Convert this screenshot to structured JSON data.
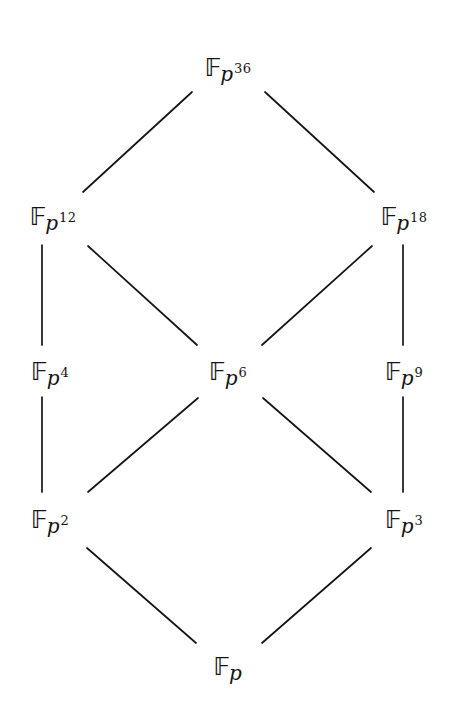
{
  "figure": {
    "name": "subfield-lattice-of-finite-field",
    "background_color": "#ffffff",
    "ink_color": "#141414",
    "width": 456,
    "height": 712
  },
  "nodes": [
    {
      "id": "p36",
      "base": "𝔽",
      "sub": "p",
      "exp": "36",
      "label": "F_p^36",
      "x": 228,
      "y": 66
    },
    {
      "id": "p12",
      "base": "𝔽",
      "sub": "p",
      "exp": "12",
      "label": "F_p^12",
      "x": 53,
      "y": 215
    },
    {
      "id": "p18",
      "base": "𝔽",
      "sub": "p",
      "exp": "18",
      "label": "F_p^18",
      "x": 404,
      "y": 215
    },
    {
      "id": "p4",
      "base": "𝔽",
      "sub": "p",
      "exp": "4",
      "label": "F_p^4",
      "x": 50,
      "y": 370
    },
    {
      "id": "p6",
      "base": "𝔽",
      "sub": "p",
      "exp": "6",
      "label": "F_p^6",
      "x": 228,
      "y": 370
    },
    {
      "id": "p9",
      "base": "𝔽",
      "sub": "p",
      "exp": "9",
      "label": "F_p^9",
      "x": 404,
      "y": 370
    },
    {
      "id": "p2",
      "base": "𝔽",
      "sub": "p",
      "exp": "2",
      "label": "F_p^2",
      "x": 50,
      "y": 518
    },
    {
      "id": "p3",
      "base": "𝔽",
      "sub": "p",
      "exp": "3",
      "label": "F_p^3",
      "x": 404,
      "y": 518
    },
    {
      "id": "p",
      "base": "𝔽",
      "sub": "p",
      "exp": "",
      "label": "F_p",
      "x": 228,
      "y": 665
    }
  ],
  "edges": [
    {
      "id": "e-p36-p12",
      "from": "p36",
      "to": "p12",
      "x1": 192,
      "y1": 92,
      "x2": 83,
      "y2": 192
    },
    {
      "id": "e-p36-p18",
      "from": "p36",
      "to": "p18",
      "x1": 265,
      "y1": 92,
      "x2": 374,
      "y2": 192
    },
    {
      "id": "e-p12-p4",
      "from": "p12",
      "to": "p4",
      "x1": 42,
      "y1": 245,
      "x2": 42,
      "y2": 345
    },
    {
      "id": "e-p12-p6",
      "from": "p12",
      "to": "p6",
      "x1": 88,
      "y1": 246,
      "x2": 197,
      "y2": 345
    },
    {
      "id": "e-p18-p9",
      "from": "p18",
      "to": "p9",
      "x1": 403,
      "y1": 245,
      "x2": 403,
      "y2": 345
    },
    {
      "id": "e-p18-p6",
      "from": "p18",
      "to": "p6",
      "x1": 372,
      "y1": 246,
      "x2": 262,
      "y2": 345
    },
    {
      "id": "e-p4-p2",
      "from": "p4",
      "to": "p2",
      "x1": 42,
      "y1": 397,
      "x2": 42,
      "y2": 492
    },
    {
      "id": "e-p6-p2",
      "from": "p6",
      "to": "p2",
      "x1": 198,
      "y1": 398,
      "x2": 88,
      "y2": 492
    },
    {
      "id": "e-p6-p3",
      "from": "p6",
      "to": "p3",
      "x1": 263,
      "y1": 398,
      "x2": 371,
      "y2": 492
    },
    {
      "id": "e-p9-p3",
      "from": "p9",
      "to": "p3",
      "x1": 403,
      "y1": 397,
      "x2": 403,
      "y2": 492
    },
    {
      "id": "e-p2-p",
      "from": "p2",
      "to": "p",
      "x1": 87,
      "y1": 548,
      "x2": 196,
      "y2": 643
    },
    {
      "id": "e-p3-p",
      "from": "p3",
      "to": "p",
      "x1": 371,
      "y1": 548,
      "x2": 262,
      "y2": 643
    }
  ]
}
